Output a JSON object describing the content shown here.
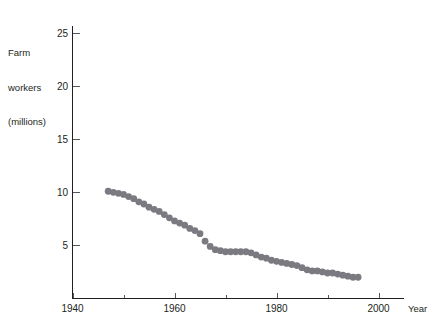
{
  "chart_data": {
    "type": "scatter",
    "title": "",
    "xlabel": "Year",
    "ylabel": "Farm workers (millions)",
    "ylabel_lines": [
      "Farm",
      "workers",
      "(millions)"
    ],
    "xlim": [
      1940,
      2005
    ],
    "ylim": [
      0,
      26
    ],
    "xticks": [
      1940,
      1960,
      1980,
      2000
    ],
    "xtick_labels": [
      "1940",
      "1960",
      "1980",
      "2000"
    ],
    "xminor_ticks": [
      1950,
      1970,
      1990
    ],
    "yticks": [
      5,
      10,
      15,
      20,
      25
    ],
    "ytick_labels": [
      "5",
      "10",
      "15",
      "20",
      "25"
    ],
    "grid": false,
    "legend": null,
    "marker": "circle",
    "marker_color": "#7a7a80",
    "marker_size": 3.4,
    "x": [
      1947,
      1948,
      1949,
      1950,
      1951,
      1952,
      1953,
      1954,
      1955,
      1956,
      1957,
      1958,
      1959,
      1960,
      1961,
      1962,
      1963,
      1964,
      1965,
      1966,
      1967,
      1968,
      1969,
      1970,
      1971,
      1972,
      1973,
      1974,
      1975,
      1976,
      1977,
      1978,
      1979,
      1980,
      1981,
      1982,
      1983,
      1984,
      1985,
      1986,
      1987,
      1988,
      1989,
      1990,
      1991,
      1992,
      1993,
      1994,
      1995,
      1996
    ],
    "values": [
      10.1,
      10.0,
      9.9,
      9.8,
      9.6,
      9.4,
      9.1,
      8.9,
      8.6,
      8.4,
      8.2,
      7.9,
      7.6,
      7.3,
      7.1,
      6.9,
      6.6,
      6.4,
      6.1,
      5.4,
      4.9,
      4.6,
      4.5,
      4.4,
      4.4,
      4.4,
      4.4,
      4.4,
      4.3,
      4.1,
      3.9,
      3.8,
      3.6,
      3.5,
      3.4,
      3.3,
      3.2,
      3.1,
      2.9,
      2.7,
      2.6,
      2.6,
      2.5,
      2.4,
      2.4,
      2.3,
      2.2,
      2.1,
      2.0,
      2.0
    ]
  },
  "axes": {
    "y_axis_title_line1": "Farm",
    "y_axis_title_line2": "workers",
    "y_axis_title_line3": "(millions)",
    "x_axis_title": "Year"
  }
}
